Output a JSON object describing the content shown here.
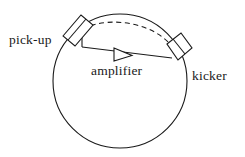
{
  "figure": {
    "background_color": "#ffffff",
    "stroke_color": "#1a1a1a",
    "labels": {
      "pickup": "pick-up",
      "amplifier": "amplifier",
      "kicker": "kicker"
    },
    "icons": {
      "ring": "storage-ring-circle",
      "pickup_device": "pickup-plate-rectangle",
      "kicker_device": "kicker-plate-rectangle",
      "amplifier_symbol": "amplifier-triangle",
      "beam_path": "dashed-beam-arc",
      "signal_path": "signal-chord-line"
    },
    "geometry": {
      "ring_center_x": 120,
      "ring_center_y": 81,
      "ring_radius": 67,
      "pickup_angle_deg": 131,
      "kicker_angle_deg": 41,
      "amplifier_triangle_x": 118,
      "amplifier_triangle_y": 55
    }
  }
}
